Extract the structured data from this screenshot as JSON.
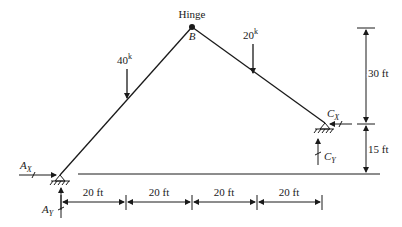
{
  "diagram": {
    "type": "three-hinged frame",
    "hinge_label": "Hinge",
    "joint_b_label": "B",
    "loads": [
      {
        "id": "load-40k",
        "value": "40",
        "unit": "k"
      },
      {
        "id": "load-20k",
        "value": "20",
        "unit": "k"
      }
    ],
    "reactions": {
      "ax": {
        "main": "A",
        "sub": "X"
      },
      "ay": {
        "main": "A",
        "sub": "Y"
      },
      "cx": {
        "main": "C",
        "sub": "X"
      },
      "cy": {
        "main": "C",
        "sub": "Y"
      }
    },
    "dimensions": {
      "horizontal": [
        "20 ft",
        "20 ft",
        "20 ft",
        "20 ft"
      ],
      "vertical_upper": "30 ft",
      "vertical_lower": "15 ft"
    },
    "colors": {
      "line": "#1a1a1a",
      "background": "#ffffff"
    }
  }
}
